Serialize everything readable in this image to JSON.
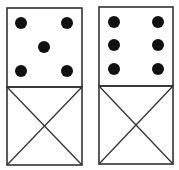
{
  "diagram": {
    "title": "",
    "stroke_color": "#333333",
    "pip_color": "#111111",
    "background": "#ffffff",
    "dominoes": [
      {
        "name": "domino-left",
        "top_value": 5,
        "bottom": "unknown (crossed)",
        "box": {
          "x": 7,
          "y": 8,
          "w": 75,
          "h": 157,
          "divider_y": 87
        },
        "pips": [
          [
            21,
            23
          ],
          [
            67,
            23
          ],
          [
            44,
            47
          ],
          [
            21,
            71
          ],
          [
            67,
            71
          ]
        ]
      },
      {
        "name": "domino-right",
        "top_value": 6,
        "bottom": "unknown (crossed)",
        "box": {
          "x": 99,
          "y": 7,
          "w": 74,
          "h": 157,
          "divider_y": 86
        },
        "pips": [
          [
            114,
            22
          ],
          [
            158,
            22
          ],
          [
            114,
            45
          ],
          [
            158,
            45
          ],
          [
            114,
            69
          ],
          [
            158,
            69
          ]
        ]
      }
    ]
  }
}
